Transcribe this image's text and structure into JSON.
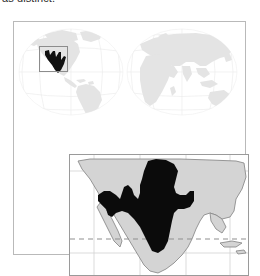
{
  "caption": {
    "text": "as distinct."
  },
  "figure": {
    "name": "species-distribution-range-map",
    "type": "map"
  },
  "colors": {
    "range_fill": "#000000",
    "land_fill_world": "#e2e2e2",
    "land_fill_detail": "#d3d3d3",
    "ocean_fill": "#ffffff",
    "graticule": "#ededed",
    "detail_graticule": "#cfcfcf",
    "frame_border": "#b9b9b9",
    "inset_border": "#9a9a9a",
    "locator_border": "#8c8c8c",
    "tropic_line": "#9a9a9a",
    "coastline_detail": "#8a8a8a"
  },
  "world_map": {
    "name": "world-locator-map",
    "projection": "double-hemisphere",
    "hemispheres": [
      {
        "name": "western-hemisphere",
        "label": "Americas"
      },
      {
        "name": "eastern-hemisphere",
        "label": "Africa Eurasia Australia"
      }
    ],
    "locator_box": {
      "name": "locator-box",
      "label": "detail area",
      "x": 25,
      "y": 24,
      "width": 29,
      "height": 26
    },
    "range_marker": {
      "name": "range-marker",
      "label": "highlighted range"
    }
  },
  "detail_map": {
    "name": "detail-inset-map",
    "region": "Western North America and Mexico",
    "graticule": {
      "vertical_lines": 4,
      "horizontal_lines": 2
    },
    "tropic_line": {
      "name": "tropic-of-cancer-line",
      "style": "dashed"
    },
    "range_polygon": {
      "name": "range-polygon",
      "fill": "#000000"
    }
  }
}
